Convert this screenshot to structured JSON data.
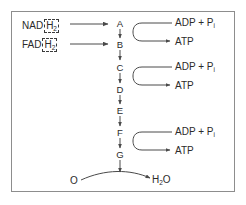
{
  "figure": {
    "border_color": "#8d8d8d",
    "background": "#ffffff",
    "stroke_color": "#4a4a4a",
    "text_color": "#2b2b2b"
  },
  "donors": [
    {
      "name": "NAD",
      "boxed": "H",
      "boxed_sub": "2",
      "full": "NAD H2"
    },
    {
      "name": "FAD",
      "boxed": "H",
      "boxed_sub": "2",
      "full": "FAD H2"
    }
  ],
  "chain": {
    "label": "electron carrier chain",
    "letters": [
      "A",
      "B",
      "C",
      "D",
      "E",
      "F",
      "G"
    ]
  },
  "phosphorylation": [
    {
      "substrate": "ADP",
      "plus": "+",
      "phosphate": "P",
      "phosphate_sub": "i",
      "product": "ATP"
    },
    {
      "substrate": "ADP",
      "plus": "+",
      "phosphate": "P",
      "phosphate_sub": "i",
      "product": "ATP"
    },
    {
      "substrate": "ADP",
      "plus": "+",
      "phosphate": "P",
      "phosphate_sub": "i",
      "product": "ATP"
    }
  ],
  "terminal": {
    "oxygen": "O",
    "water": "H",
    "water_sub": "2",
    "water_tail": "O",
    "water_full": "H2O"
  }
}
